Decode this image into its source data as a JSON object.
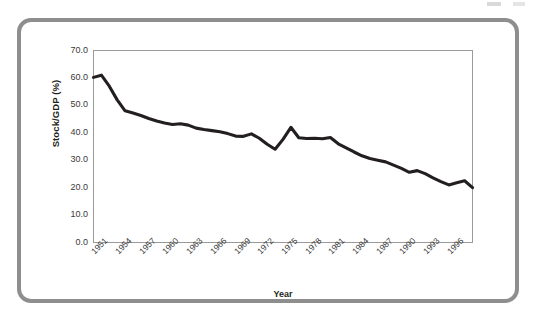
{
  "figure": {
    "frame_color": "#8e8e8e",
    "background": "#ffffff",
    "plot_border_color": "#9a9a9a",
    "series_color": "#231f20"
  },
  "chart_data": {
    "type": "line",
    "title": "",
    "xlabel": "Year",
    "ylabel": "Stock/GDP (%)",
    "xlim": [
      1950,
      1998
    ],
    "ylim": [
      0.0,
      70.0
    ],
    "grid": false,
    "legend": null,
    "ytick_labels": [
      "70.0",
      "60.0",
      "50.0",
      "40.0",
      "30.0",
      "20.0",
      "10.0",
      "0.0"
    ],
    "ytick_values": [
      70.0,
      60.0,
      50.0,
      40.0,
      30.0,
      20.0,
      10.0,
      0.0
    ],
    "xtick_labels": [
      "1951",
      "1954",
      "1957",
      "1960",
      "1963",
      "1966",
      "1969",
      "1972",
      "1975",
      "1978",
      "1981",
      "1984",
      "1987",
      "1990",
      "1993",
      "1996"
    ],
    "xtick_values": [
      1951,
      1954,
      1957,
      1960,
      1963,
      1966,
      1969,
      1972,
      1975,
      1978,
      1981,
      1984,
      1987,
      1990,
      1993,
      1996
    ],
    "series": [
      {
        "name": "Stock/GDP (%)",
        "x": [
          1950,
          1951,
          1952,
          1953,
          1954,
          1955,
          1956,
          1957,
          1958,
          1959,
          1960,
          1961,
          1962,
          1963,
          1964,
          1965,
          1966,
          1967,
          1968,
          1969,
          1970,
          1971,
          1972,
          1973,
          1974,
          1975,
          1976,
          1977,
          1978,
          1979,
          1980,
          1981,
          1982,
          1983,
          1984,
          1985,
          1986,
          1987,
          1988,
          1989,
          1990,
          1991,
          1992,
          1993,
          1994,
          1995,
          1996,
          1997,
          1998
        ],
        "values": [
          60.2,
          61.0,
          57.0,
          52.0,
          48.0,
          47.2,
          46.3,
          45.2,
          44.3,
          43.6,
          43.0,
          43.3,
          42.8,
          41.7,
          41.2,
          40.8,
          40.4,
          39.7,
          38.8,
          38.7,
          39.6,
          38.0,
          35.8,
          34.0,
          37.6,
          42.0,
          38.2,
          37.9,
          38.0,
          37.8,
          38.3,
          36.0,
          34.5,
          33.0,
          31.6,
          30.6,
          30.0,
          29.4,
          28.2,
          27.0,
          25.6,
          26.2,
          25.1,
          23.6,
          22.2,
          21.0,
          21.8,
          22.5,
          20.0
        ]
      }
    ]
  }
}
